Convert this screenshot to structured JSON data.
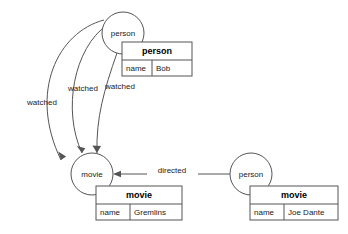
{
  "diagram": {
    "type": "property-graph",
    "background_color": "#ffffff",
    "stroke_color": "#555555",
    "text_color": "#1a1a1a",
    "nodes": [
      {
        "id": "person-top",
        "label": "person",
        "cx": 123,
        "cy": 33,
        "r": 21
      },
      {
        "id": "movie-left",
        "label": "movie",
        "cx": 92,
        "cy": 174,
        "r": 21
      },
      {
        "id": "person-right",
        "label": "person",
        "cx": 251,
        "cy": 174,
        "r": 21
      }
    ],
    "property_tables": [
      {
        "id": "person-top-props",
        "title": "person",
        "key": "name",
        "value": "Bob",
        "x": 122,
        "y": 42,
        "width": 70,
        "height": 34
      },
      {
        "id": "movie-left-props",
        "title": "movie",
        "key": "name",
        "value": "Gremlins",
        "x": 96,
        "y": 186,
        "width": 86,
        "height": 34
      },
      {
        "id": "person-right-props",
        "title": "movie",
        "key": "name",
        "value": "Joe Dante",
        "x": 250,
        "y": 186,
        "width": 88,
        "height": 34
      }
    ],
    "edges": [
      {
        "id": "watched-outer",
        "label": "watched",
        "from": "person-top",
        "to": "movie-left",
        "label_x": 42,
        "label_y": 103
      },
      {
        "id": "watched-middle",
        "label": "watched",
        "from": "person-top",
        "to": "movie-left",
        "label_x": 83,
        "label_y": 89
      },
      {
        "id": "watched-inner",
        "label": "watched",
        "from": "person-top",
        "to": "movie-left",
        "label_x": 120,
        "label_y": 87
      },
      {
        "id": "directed",
        "label": "directed",
        "from": "person-right",
        "to": "movie-left",
        "label_x": 172,
        "label_y": 168
      }
    ]
  }
}
